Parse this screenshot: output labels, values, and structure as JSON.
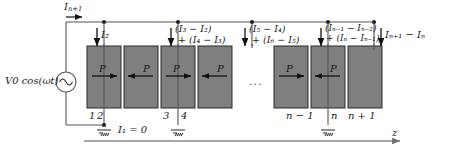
{
  "figure": {
    "type": "circuit-diagram",
    "colors": {
      "block_fill": "#7f7f7f",
      "block_edge": "#2b2b2b",
      "wire": "#55555a",
      "axis": "#8a8a8a",
      "text": "#1a1a1a"
    }
  },
  "source": {
    "label": "V0 cos(ωt)",
    "v_symbol": "V",
    "v_sub": "0",
    "rest": "cos(ωt)",
    "icon": "ac-source-icon"
  },
  "top": {
    "feed_current": {
      "main": "I",
      "sub": "n+1"
    },
    "arrow": "arrow-right-icon"
  },
  "node_currents": [
    {
      "id": "n2",
      "line1": "I₂",
      "line2": ""
    },
    {
      "id": "n3",
      "line1": "(I₃ − I₂)",
      "line2": "+ (I₄ − I₃)"
    },
    {
      "id": "n5",
      "line1": "(I₅ − I₄)",
      "line2": "+ (I₆ − I₅)"
    },
    {
      "id": "nn",
      "line1": "(Iₙ₋₁ − Iₙ₋₂)",
      "line2": "+ (Iₙ − Iₙ₋₁)"
    },
    {
      "id": "nn1",
      "line1": "Iₙ₊₁ − Iₙ",
      "line2": ""
    }
  ],
  "blocks": [
    {
      "id": "b1",
      "label": "P",
      "arrow": "right"
    },
    {
      "id": "b2",
      "label": "P",
      "arrow": "left"
    },
    {
      "id": "b3",
      "label": "P",
      "arrow": "right"
    },
    {
      "id": "b4",
      "label": "P",
      "arrow": "left"
    },
    {
      "id": "b5",
      "label": "P",
      "arrow": "right"
    },
    {
      "id": "b6",
      "label": "P",
      "arrow": "left"
    }
  ],
  "ellipsis": "...",
  "node_labels": [
    {
      "id": "p1",
      "text": "1"
    },
    {
      "id": "p2",
      "text": "2"
    },
    {
      "id": "p3",
      "text": "3"
    },
    {
      "id": "p4",
      "text": "4"
    },
    {
      "id": "pn1",
      "text": "n − 1"
    },
    {
      "id": "pn",
      "text": "n"
    },
    {
      "id": "pn2",
      "text": "n + 1"
    }
  ],
  "annotations": {
    "zero_current": "I₁ = 0",
    "axis_label": "z"
  },
  "grounds": [
    {
      "id": "g2",
      "icon": "ground-icon"
    },
    {
      "id": "g4",
      "icon": "ground-icon"
    },
    {
      "id": "gn",
      "icon": "ground-icon"
    }
  ]
}
